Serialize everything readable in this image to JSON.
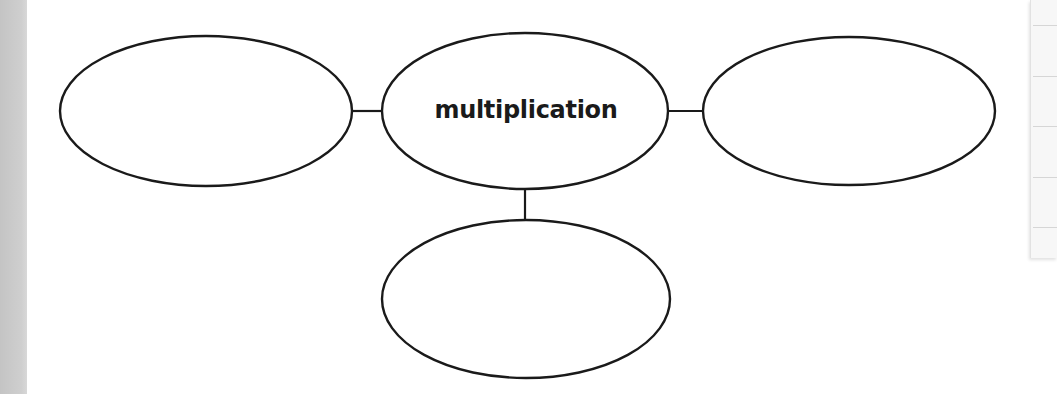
{
  "diagram": {
    "type": "concept-web",
    "center_node": {
      "label": "multiplication"
    },
    "nodes": [
      {
        "id": "center",
        "label": "multiplication",
        "cx": 525,
        "cy": 111,
        "rx": 143,
        "ry": 78
      },
      {
        "id": "left",
        "label": "",
        "cx": 206,
        "cy": 111,
        "rx": 146,
        "ry": 75
      },
      {
        "id": "right",
        "label": "",
        "cx": 849,
        "cy": 111,
        "rx": 146,
        "ry": 74
      },
      {
        "id": "bottom",
        "label": "",
        "cx": 526,
        "cy": 299,
        "rx": 144,
        "ry": 79
      }
    ],
    "edges": [
      {
        "from": "center",
        "to": "left"
      },
      {
        "from": "center",
        "to": "right"
      },
      {
        "from": "center",
        "to": "bottom"
      }
    ],
    "stroke_color": "#1a1a1a"
  }
}
